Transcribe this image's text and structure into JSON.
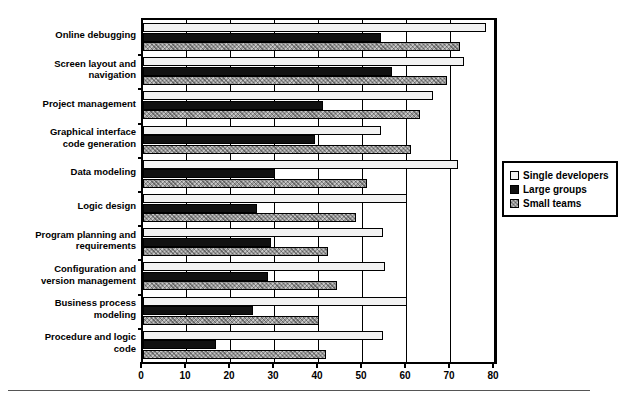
{
  "chart_data": {
    "type": "bar",
    "orientation": "horizontal",
    "title": "",
    "xlabel": "",
    "ylabel": "",
    "xlim": [
      0,
      80
    ],
    "xticks": [
      0,
      10,
      20,
      30,
      40,
      50,
      60,
      70,
      80
    ],
    "grid": "vertical",
    "legend_position": "right",
    "categories": [
      "Online debugging",
      "Screen layout and navigation",
      "Project management",
      "Graphical interface code generation",
      "Data modeling",
      "Logic design",
      "Program planning and requirements",
      "Configuration and version management",
      "Business process modeling",
      "Procedure and logic code"
    ],
    "series": [
      {
        "name": "Single developers",
        "color": "#f2f2f2",
        "values": [
          78,
          73,
          66,
          54,
          71.5,
          60,
          54.5,
          55,
          60,
          54.5
        ]
      },
      {
        "name": "Large groups",
        "color": "#111111",
        "values": [
          54,
          56.5,
          41,
          39,
          30,
          26,
          29,
          28.5,
          25,
          16.5
        ]
      },
      {
        "name": "Small teams",
        "color": "#9a9a9a",
        "values": [
          72,
          69,
          63,
          61,
          51,
          48.5,
          42,
          44,
          40,
          41.5
        ]
      }
    ]
  },
  "categories_display": [
    [
      "Online debugging"
    ],
    [
      "Screen layout and",
      "navigation"
    ],
    [
      "Project management"
    ],
    [
      "Graphical interface",
      "code generation"
    ],
    [
      "Data modeling"
    ],
    [
      "Logic design"
    ],
    [
      "Program planning and",
      "requirements"
    ],
    [
      "Configuration and",
      "version management"
    ],
    [
      "Business process",
      "modeling"
    ],
    [
      "Procedure and logic",
      "code"
    ]
  ],
  "legend": {
    "items": [
      {
        "label": "Single developers",
        "swatch": "single"
      },
      {
        "label": "Large groups",
        "swatch": "large"
      },
      {
        "label": "Small teams",
        "swatch": "small"
      }
    ]
  },
  "axis": {
    "x_tick_labels": [
      "0",
      "10",
      "20",
      "30",
      "40",
      "50",
      "60",
      "70",
      "80"
    ]
  }
}
